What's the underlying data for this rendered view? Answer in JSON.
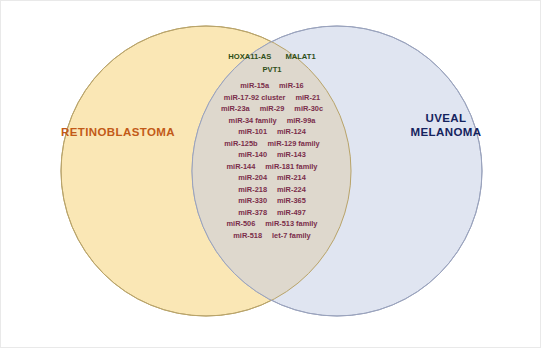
{
  "figure": {
    "type": "venn-diagram",
    "colors": {
      "left_circle_fill": "#fae7b5",
      "right_circle_fill": "#dde3f0",
      "intersection_fill": "#ded8cd",
      "left_circle_stroke": "#b9a46a",
      "right_circle_stroke": "#9aa3bd",
      "left_label_color": "#c25a18",
      "right_label_color": "#14235e",
      "lncrna_text_color": "#2f4f18",
      "mirna_text_color": "#7a2d4a",
      "background": "#ffffff"
    }
  },
  "left_set": {
    "label": "RETINOBLASTOMA",
    "unique_items": []
  },
  "right_set": {
    "label_line1": "UVEAL",
    "label_line2": "MELANOMA",
    "unique_items": []
  },
  "intersection": {
    "lncrna_rows": [
      [
        "HOXA11-AS",
        "MALAT1"
      ],
      [
        "PVT1"
      ]
    ],
    "mirna_rows": [
      [
        "miR-15a",
        "miR-16"
      ],
      [
        "miR-17-92 cluster",
        "miR-21"
      ],
      [
        "miR-23a",
        "miR-29",
        "miR-30c"
      ],
      [
        "miR-34 family",
        "miR-99a"
      ],
      [
        "miR-101",
        "miR-124"
      ],
      [
        "miR-125b",
        "miR-129 family"
      ],
      [
        "miR-140",
        "miR-143"
      ],
      [
        "miR-144",
        "miR-181 family"
      ],
      [
        "miR-204",
        "miR-214"
      ],
      [
        "miR-218",
        "miR-224"
      ],
      [
        "miR-330",
        "miR-365"
      ],
      [
        "miR-378",
        "miR-497"
      ],
      [
        "miR-506",
        "miR-513 family"
      ],
      [
        "miR-518",
        "let-7 family"
      ]
    ]
  }
}
